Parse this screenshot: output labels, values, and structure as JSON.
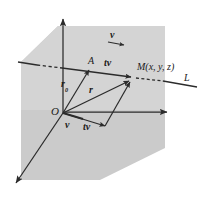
{
  "figure": {
    "type": "vector-line-geometry-diagram",
    "colors": {
      "plane_fill": "#c9c9c9",
      "plane_fill_light": "#d6d6d6",
      "stroke": "#2b2b2b",
      "background": "#ffffff",
      "text": "#1a1a1a"
    },
    "labels": {
      "origin": "O",
      "point_a": "A",
      "point_m": "M(x, y, z)",
      "line": "L",
      "vector_r0_base": "r",
      "vector_r0_sub": "0",
      "vector_r": "r",
      "vector_v_top": "v",
      "vector_tv_top": "tv",
      "vector_v_bottom": "v",
      "vector_tv_bottom": "tv"
    },
    "geometry": {
      "origin_point": [
        63,
        113
      ],
      "point_a": [
        92,
        67
      ],
      "point_m": [
        133,
        76
      ],
      "z_axis_tip": [
        63,
        15
      ],
      "x_axis_tip": [
        172,
        112
      ],
      "y_axis_tip": [
        13,
        187
      ],
      "line_left_end": [
        18,
        62
      ],
      "line_right_end": [
        196,
        86
      ],
      "plane_polygon": "58,26 165,26 165,148 100,180 21,180 21,62"
    }
  }
}
